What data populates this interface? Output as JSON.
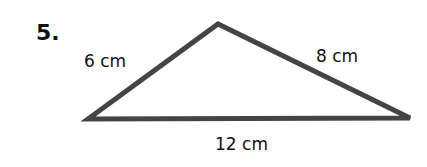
{
  "problem": {
    "number": "5.",
    "figure": "triangle",
    "sides": {
      "left": "6 cm",
      "right": "8 cm",
      "base": "12 cm"
    },
    "vertices": {
      "left": [
        88,
        119
      ],
      "apex": [
        218,
        24
      ],
      "right": [
        410,
        118
      ]
    },
    "stroke_color": "#444444"
  }
}
